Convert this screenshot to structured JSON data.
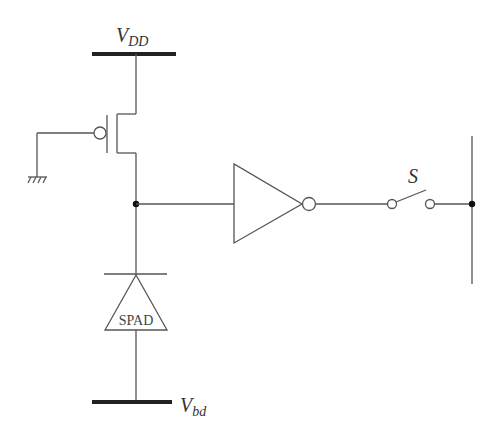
{
  "diagram": {
    "labels": {
      "vdd_main": "V",
      "vdd_sub": "DD",
      "vbd_main": "V",
      "vbd_sub": "bd",
      "switch": "S",
      "spad": "SPAD"
    },
    "components": [
      {
        "id": "vdd-rail",
        "type": "supply-rail",
        "label": "VDD"
      },
      {
        "id": "pmos",
        "type": "pmos-transistor",
        "gate": "ground"
      },
      {
        "id": "ground",
        "type": "ground"
      },
      {
        "id": "sense-node",
        "type": "node"
      },
      {
        "id": "inverter",
        "type": "inverter"
      },
      {
        "id": "switch",
        "type": "switch",
        "label": "S",
        "state": "open"
      },
      {
        "id": "output-bus",
        "type": "bus-line"
      },
      {
        "id": "spad",
        "type": "spad-diode",
        "label": "SPAD"
      },
      {
        "id": "vbd-rail",
        "type": "supply-rail",
        "label": "Vbd"
      }
    ],
    "colors": {
      "wire": "#555555",
      "rail": "#222222",
      "background": "#ffffff"
    }
  }
}
